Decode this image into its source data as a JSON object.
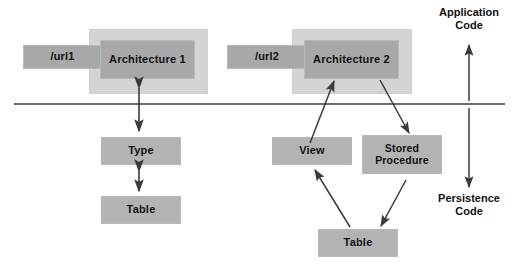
{
  "diagram": {
    "divider": {
      "label": "",
      "y": 104,
      "x1": 14,
      "x2": 505,
      "color": "#3a3a3a"
    },
    "colors": {
      "halo": "#d4d4d4",
      "box_fill": "#a8a8a8",
      "box_fill_light": "#b3b3b3",
      "line": "#3a3a3a",
      "text": "#111111",
      "background": "#ffffff"
    },
    "groups": [
      {
        "id": "architecture-1-group",
        "halo": {
          "x": 89,
          "y": 29,
          "w": 119,
          "h": 65
        },
        "url_box": {
          "label": "/url1",
          "x": 23,
          "y": 45,
          "w": 79,
          "h": 24
        },
        "arch_box": {
          "label": "Architecture 1",
          "x": 100,
          "y": 40,
          "w": 95,
          "h": 39
        }
      },
      {
        "id": "architecture-2-group",
        "halo": {
          "x": 292,
          "y": 29,
          "w": 120,
          "h": 65
        },
        "url_box": {
          "label": "/url2",
          "x": 227,
          "y": 45,
          "w": 80,
          "h": 24
        },
        "arch_box": {
          "label": "Architecture 2",
          "x": 304,
          "y": 40,
          "w": 95,
          "h": 39
        }
      }
    ],
    "nodes": [
      {
        "id": "type-box",
        "label": "Type",
        "x": 101,
        "y": 137,
        "w": 80,
        "h": 28
      },
      {
        "id": "table-left-box",
        "label": "Table",
        "x": 101,
        "y": 196,
        "w": 80,
        "h": 28
      },
      {
        "id": "view-box",
        "label": "View",
        "x": 272,
        "y": 137,
        "w": 80,
        "h": 28
      },
      {
        "id": "stored-procedure-box",
        "label": "Stored Procedure",
        "x": 362,
        "y": 135,
        "w": 80,
        "h": 39
      },
      {
        "id": "table-right-box",
        "label": "Table",
        "x": 318,
        "y": 229,
        "w": 80,
        "h": 28
      }
    ],
    "side_labels": [
      {
        "id": "application-code-label",
        "line1": "Application",
        "line2": "Code",
        "x": 424,
        "y": 6,
        "w": 90
      },
      {
        "id": "persistence-code-label",
        "line1": "Persistence",
        "line2": "Code",
        "x": 424,
        "y": 192,
        "w": 90
      }
    ],
    "connectors": [
      {
        "id": "arch1-to-type-connector",
        "type": "double-arrow",
        "x1": 139,
        "y1": 86,
        "x2": 139,
        "y2": 133
      },
      {
        "id": "type-to-table-connector",
        "type": "double-arrow",
        "x1": 139,
        "y1": 170,
        "x2": 139,
        "y2": 192
      },
      {
        "id": "view-to-arch2-connector",
        "type": "arrow",
        "x1": 311,
        "y1": 144,
        "x2": 334,
        "y2": 80
      },
      {
        "id": "arch2-to-stored-procedure-connector",
        "type": "arrow",
        "x1": 381,
        "y1": 79,
        "x2": 409,
        "y2": 134
      },
      {
        "id": "table-to-view-connector",
        "type": "arrow",
        "x1": 350,
        "y1": 228,
        "x2": 315,
        "y2": 170
      },
      {
        "id": "stored-procedure-to-table-connector",
        "type": "arrow",
        "x1": 405,
        "y1": 179,
        "x2": 380,
        "y2": 227
      },
      {
        "id": "application-code-arrow",
        "type": "arrow",
        "x1": 469,
        "y1": 101,
        "x2": 469,
        "y2": 44
      },
      {
        "id": "persistence-code-arrow",
        "type": "arrow",
        "x1": 469,
        "y1": 108,
        "x2": 469,
        "y2": 188
      }
    ]
  }
}
